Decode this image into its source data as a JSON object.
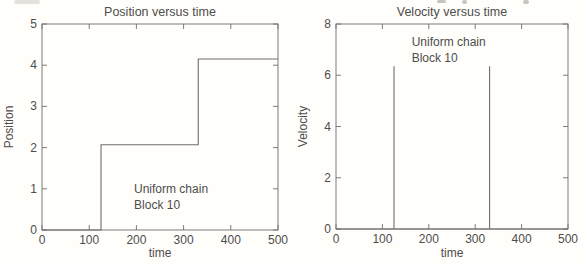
{
  "page": {
    "background": "#fffefb",
    "style": "scanned-matlab-figure",
    "colors": {
      "frame": "#7a7a7a",
      "data_line": "#6e6e6e",
      "text": "#4d4d4d",
      "artifact": "#b8b6b1"
    }
  },
  "chart_data": [
    {
      "id": "position",
      "type": "line",
      "title": "Position versus time",
      "xlabel": "time",
      "ylabel": "Position",
      "xlim": [
        0,
        500
      ],
      "ylim": [
        0,
        5
      ],
      "xticks": [
        0,
        100,
        200,
        300,
        400,
        500
      ],
      "yticks": [
        0,
        1,
        2,
        3,
        4,
        5
      ],
      "grid": false,
      "legend": "none",
      "series": [
        {
          "name": "position-step-trace",
          "points": [
            [
              0,
              0
            ],
            [
              125,
              0
            ],
            [
              125,
              2.07
            ],
            [
              331,
              2.07
            ],
            [
              331,
              4.15
            ],
            [
              500,
              4.15
            ]
          ]
        }
      ],
      "annotations": [
        {
          "text": "Uniform chain",
          "x": 195,
          "y": 0.9
        },
        {
          "text": "Block 10",
          "x": 195,
          "y": 0.51
        }
      ]
    },
    {
      "id": "velocity",
      "type": "line",
      "title": "Velocity versus time",
      "xlabel": "time",
      "ylabel": "Velocity",
      "xlim": [
        0,
        500
      ],
      "ylim": [
        0,
        8
      ],
      "xticks": [
        0,
        100,
        200,
        300,
        400,
        500
      ],
      "yticks": [
        0,
        2,
        4,
        6,
        8
      ],
      "grid": false,
      "legend": "none",
      "series": [
        {
          "name": "velocity-spike-trace",
          "points": [
            [
              0,
              0
            ],
            [
              125,
              0
            ],
            [
              125,
              6.35
            ],
            [
              125,
              0
            ],
            [
              331,
              0
            ],
            [
              331,
              6.35
            ],
            [
              331,
              0
            ],
            [
              500,
              0
            ]
          ]
        }
      ],
      "annotations": [
        {
          "text": "Uniform chain",
          "x": 163,
          "y": 7.15
        },
        {
          "text": "Block 10",
          "x": 163,
          "y": 6.52
        }
      ]
    }
  ]
}
